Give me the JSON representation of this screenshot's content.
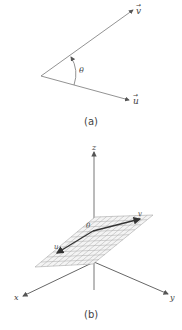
{
  "figure_a": {
    "caption": "(a)",
    "vector_v_label": "v",
    "vector_u_label": "u",
    "angle_label": "θ"
  },
  "figure_b": {
    "caption": "(b)",
    "axis_x_label": "x",
    "axis_y_label": "y",
    "axis_z_label": "z",
    "vector_v_label": "v",
    "vector_u_label": "u",
    "angle_label": "θ"
  },
  "colors": {
    "line": "#666666",
    "text": "#444444",
    "grid": "#aaaaaa"
  }
}
